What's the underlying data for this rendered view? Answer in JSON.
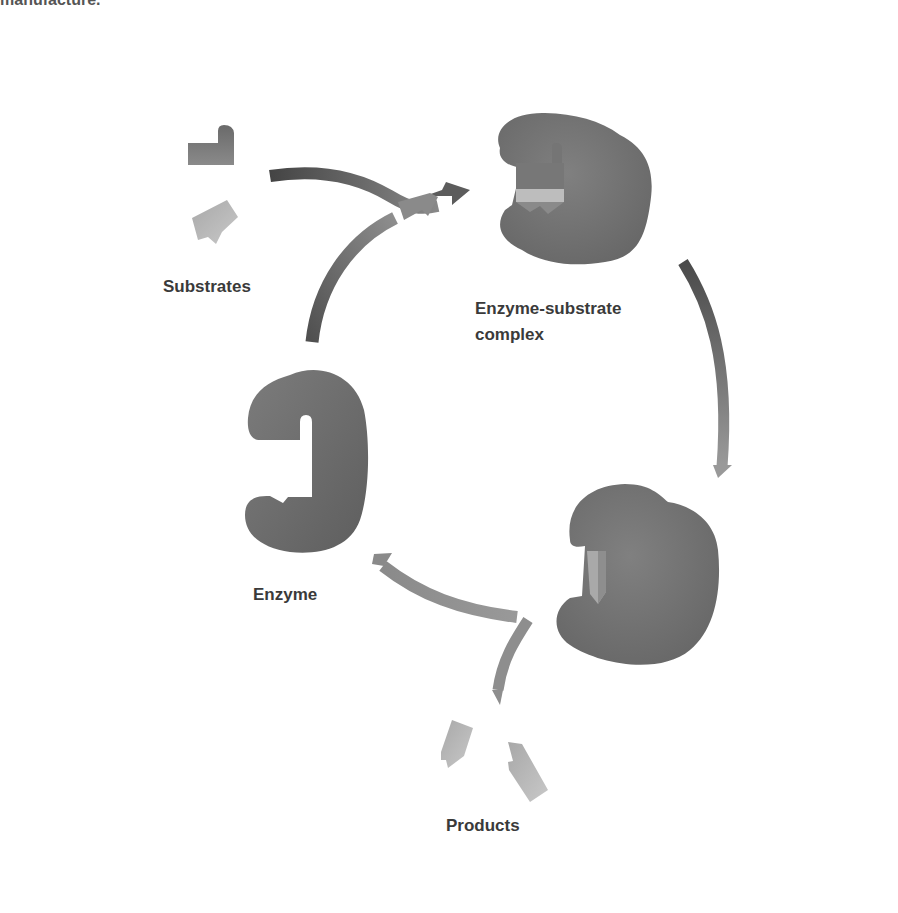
{
  "header": {
    "cut_off_text": "manufacture."
  },
  "diagram": {
    "labels": {
      "substrates": "Substrates",
      "complex_line1": "Enzyme-substrate",
      "complex_line2": "complex",
      "enzyme": "Enzyme",
      "products": "Products"
    },
    "colors": {
      "background": "#ffffff",
      "enzyme_fill": "#6f6f6f",
      "enzyme_fill_dark": "#555555",
      "substrate_dark": "#707070",
      "substrate_light": "#b8b8b8",
      "arrow_dark": "#4a4a4a",
      "arrow_light": "#9a9a9a",
      "label_text": "#3a3a3a"
    },
    "nodes": [
      {
        "id": "substrates",
        "label": "Substrates"
      },
      {
        "id": "enzyme-substrate-complex",
        "label": "Enzyme-substrate complex"
      },
      {
        "id": "enzyme-product-complex",
        "label": ""
      },
      {
        "id": "products",
        "label": "Products"
      },
      {
        "id": "enzyme",
        "label": "Enzyme"
      }
    ],
    "edges": [
      {
        "from": "substrates",
        "to": "enzyme-substrate-complex"
      },
      {
        "from": "enzyme",
        "to": "enzyme-substrate-complex"
      },
      {
        "from": "enzyme-substrate-complex",
        "to": "enzyme-product-complex"
      },
      {
        "from": "enzyme-product-complex",
        "to": "enzyme"
      },
      {
        "from": "enzyme-product-complex",
        "to": "products"
      }
    ]
  }
}
